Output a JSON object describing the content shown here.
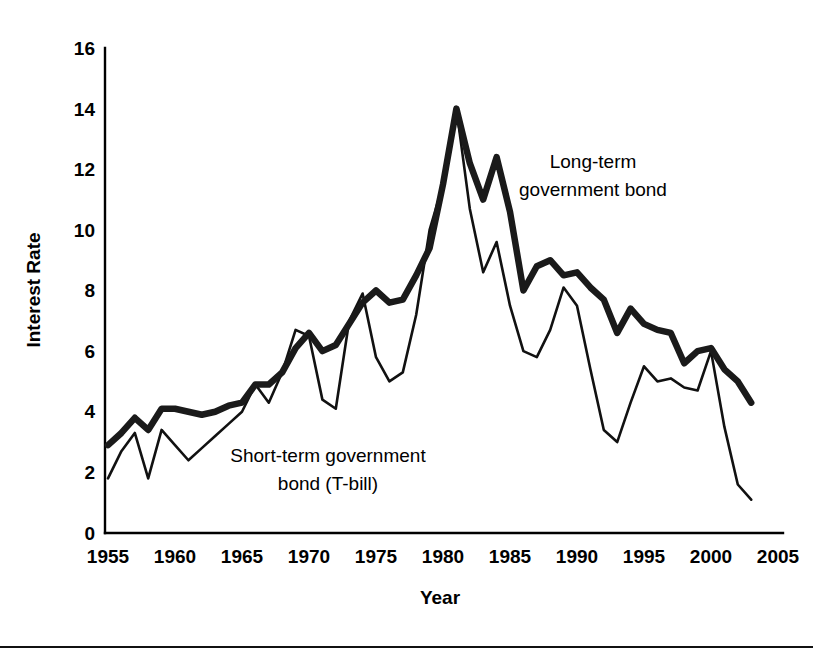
{
  "figure": {
    "background_color": "#ffffff",
    "ink_color": "#000000",
    "footer_rule_y": 646
  },
  "chart_data": {
    "type": "line",
    "title": "",
    "xlabel": "Year",
    "ylabel": "Interest Rate",
    "xlim": [
      1955,
      2005
    ],
    "ylim": [
      0,
      16
    ],
    "grid": false,
    "legend_position": "inline-annotation",
    "x_ticks": [
      "1955",
      "1960",
      "1965",
      "1970",
      "1975",
      "1980",
      "1985",
      "1990",
      "1995",
      "2000",
      "2005"
    ],
    "y_ticks": [
      "0",
      "2",
      "4",
      "6",
      "8",
      "10",
      "12",
      "14",
      "16"
    ],
    "x": [
      1955,
      1956,
      1957,
      1958,
      1959,
      1960,
      1961,
      1962,
      1963,
      1964,
      1965,
      1966,
      1967,
      1968,
      1969,
      1970,
      1971,
      1972,
      1973,
      1974,
      1975,
      1976,
      1977,
      1978,
      1979,
      1980,
      1981,
      1982,
      1983,
      1984,
      1985,
      1986,
      1987,
      1988,
      1989,
      1990,
      1991,
      1992,
      1993,
      1994,
      1995,
      1996,
      1997,
      1998,
      1999,
      2000,
      2001,
      2002,
      2003
    ],
    "series": [
      {
        "name": "Long-term government bond",
        "style": "thick",
        "values": [
          2.9,
          3.3,
          3.8,
          3.4,
          4.1,
          4.1,
          4.0,
          3.9,
          4.0,
          4.2,
          4.3,
          4.9,
          4.9,
          5.3,
          6.1,
          6.6,
          6.0,
          6.2,
          6.9,
          7.6,
          8.0,
          7.6,
          7.7,
          8.5,
          9.4,
          11.5,
          14.0,
          12.2,
          11.0,
          12.4,
          10.6,
          8.0,
          8.8,
          9.0,
          8.5,
          8.6,
          8.1,
          7.7,
          6.6,
          7.4,
          6.9,
          6.7,
          6.6,
          5.6,
          6.0,
          6.1,
          5.4,
          5.0,
          4.3
        ]
      },
      {
        "name": "Short-term government bond (T-bill)",
        "style": "thin",
        "values": [
          1.8,
          2.7,
          3.3,
          1.8,
          3.4,
          2.9,
          2.4,
          2.8,
          3.2,
          3.6,
          4.0,
          4.9,
          4.3,
          5.3,
          6.7,
          6.5,
          4.4,
          4.1,
          7.0,
          7.9,
          5.8,
          5.0,
          5.3,
          7.2,
          10.0,
          11.5,
          14.0,
          10.7,
          8.6,
          9.6,
          7.5,
          6.0,
          5.8,
          6.7,
          8.1,
          7.5,
          5.4,
          3.4,
          3.0,
          4.3,
          5.5,
          5.0,
          5.1,
          4.8,
          4.7,
          6.0,
          3.5,
          1.6,
          1.1
        ]
      }
    ],
    "annotations": [
      {
        "id": "long-term-label",
        "lines": [
          "Long-term",
          "government bond"
        ],
        "x_px": 593,
        "y_px": 168
      },
      {
        "id": "short-term-label",
        "lines": [
          "Short-term government",
          "bond (T-bill)"
        ],
        "x_px": 328,
        "y_px": 462
      }
    ]
  }
}
